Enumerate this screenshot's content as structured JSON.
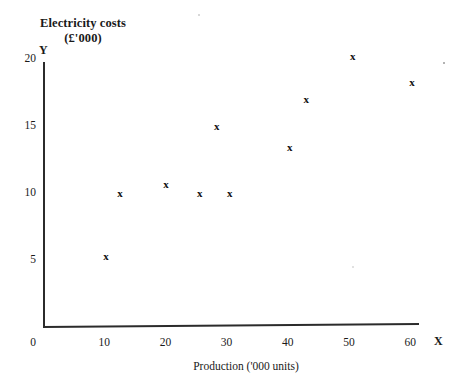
{
  "chart_data": {
    "type": "scatter",
    "title": "Electricity costs (£'000)",
    "title_line1": "Electricity costs",
    "title_line2": "(£'000)",
    "xlabel": "Production ('000 units)",
    "ylabel": "Electricity costs (£'000)",
    "x_axis_letter": "X",
    "y_axis_letter": "Y",
    "xlim": [
      0,
      62
    ],
    "ylim": [
      0,
      21.5
    ],
    "grid": false,
    "legend": null,
    "x_ticks": [
      {
        "value": 0,
        "label": "0"
      },
      {
        "value": 10,
        "label": "10"
      },
      {
        "value": 20,
        "label": "20"
      },
      {
        "value": 30,
        "label": "30"
      },
      {
        "value": 40,
        "label": "40"
      },
      {
        "value": 50,
        "label": "50"
      },
      {
        "value": 60,
        "label": "60"
      }
    ],
    "y_ticks": [
      {
        "value": 0,
        "label": "0"
      },
      {
        "value": 5,
        "label": "5"
      },
      {
        "value": 10,
        "label": "10"
      },
      {
        "value": 15,
        "label": "15"
      },
      {
        "value": 20,
        "label": "20"
      }
    ],
    "marker": "x",
    "series": [
      {
        "name": "Electricity costs vs production",
        "marker": "x",
        "points": [
          {
            "x": 10.3,
            "y": 5.3
          },
          {
            "x": 12.6,
            "y": 10.0
          },
          {
            "x": 20.1,
            "y": 10.7
          },
          {
            "x": 25.6,
            "y": 10.0
          },
          {
            "x": 28.4,
            "y": 15.0
          },
          {
            "x": 30.5,
            "y": 10.0
          },
          {
            "x": 40.3,
            "y": 13.4
          },
          {
            "x": 43.0,
            "y": 17.0
          },
          {
            "x": 50.6,
            "y": 20.2
          },
          {
            "x": 60.3,
            "y": 18.3
          }
        ]
      }
    ]
  },
  "colors": {
    "axis": "#2b2b2b",
    "marker": "#111111",
    "text": "#1a1a1a",
    "background": "#ffffff"
  }
}
